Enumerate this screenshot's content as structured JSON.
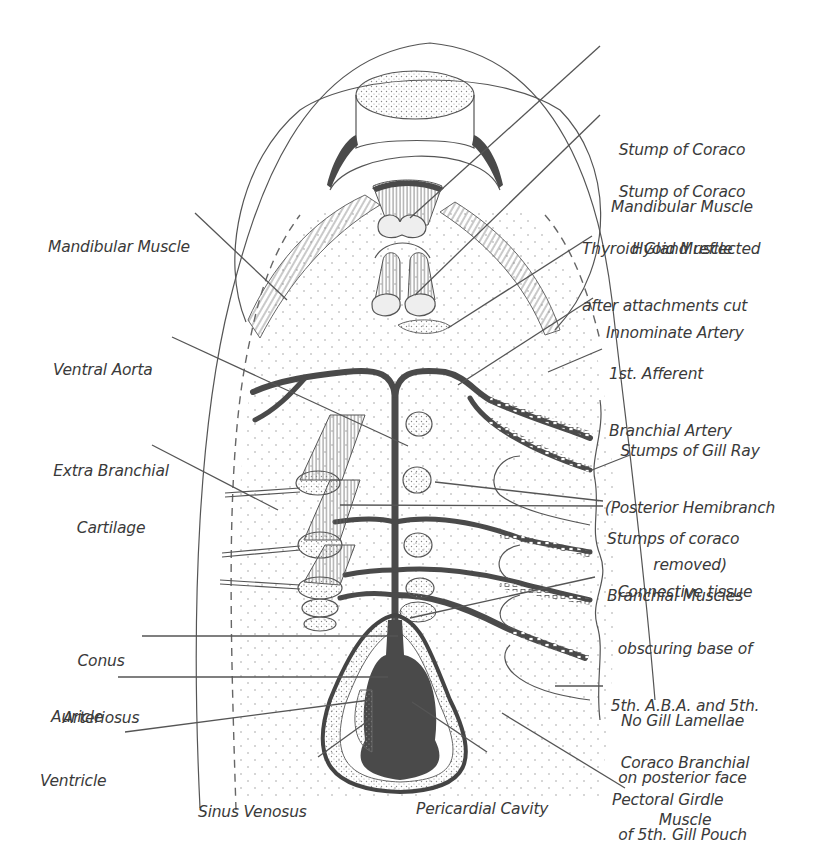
{
  "figure": {
    "colors": {
      "ink": "#4a4a4a",
      "label_text": "#3a3a3a",
      "background": "#ffffff"
    },
    "labels_left": [
      {
        "id": "mandibular-muscle",
        "lines": [
          "Mandibular Muscle"
        ]
      },
      {
        "id": "ventral-aorta",
        "lines": [
          "Ventral Aorta"
        ]
      },
      {
        "id": "extra-branchial-cartilage",
        "lines": [
          "Extra Branchial",
          "Cartilage"
        ]
      },
      {
        "id": "conus-arteriosus",
        "lines": [
          "Conus",
          "Arteriosus"
        ]
      },
      {
        "id": "auricle",
        "lines": [
          "Auricle"
        ]
      },
      {
        "id": "ventricle",
        "lines": [
          "Ventricle"
        ]
      }
    ],
    "labels_right": [
      {
        "id": "stump-coraco-mandibular",
        "lines": [
          "Stump of Coraco",
          "Mandibular Muscle"
        ]
      },
      {
        "id": "stump-coraco-hyoid",
        "lines": [
          "Stump of Coraco",
          "Hyoid Muscle"
        ]
      },
      {
        "id": "thyroid-gland",
        "lines": [
          "Thyroid Gland reflected",
          "after attachments cut"
        ]
      },
      {
        "id": "innominate-artery",
        "lines": [
          "Innominate Artery"
        ]
      },
      {
        "id": "first-afferent-branchial-artery",
        "lines": [
          "1st. Afferent",
          "Branchial Artery"
        ]
      },
      {
        "id": "stumps-gill-ray",
        "lines": [
          "Stumps of Gill Ray",
          "(Posterior Hemibranch",
          "removed)"
        ]
      },
      {
        "id": "stumps-coraco-branchial",
        "lines": [
          "Stumps of coraco",
          "Branchial Muscles"
        ]
      },
      {
        "id": "connective-tissue",
        "lines": [
          "Connective tissue",
          "obscuring base of",
          "5th. A.B.A. and 5th.",
          "Coraco Branchial",
          "Muscle"
        ]
      },
      {
        "id": "no-gill-lamellae",
        "lines": [
          "No Gill Lamellae",
          "on posterior face",
          "of 5th. Gill Pouch"
        ]
      },
      {
        "id": "pectoral-girdle",
        "lines": [
          "Pectoral Girdle"
        ]
      }
    ],
    "labels_bottom": [
      {
        "id": "sinus-venosus",
        "lines": [
          "Sinus Venosus"
        ]
      },
      {
        "id": "pericardial-cavity",
        "lines": [
          "Pericardial Cavity"
        ]
      }
    ]
  }
}
